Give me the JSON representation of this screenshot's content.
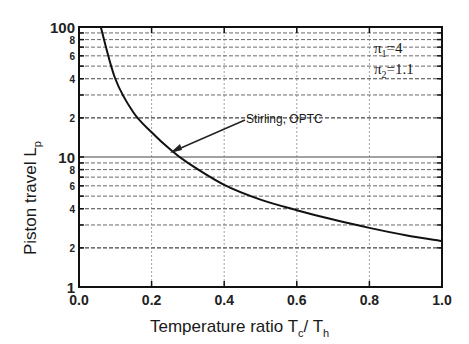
{
  "chart_data": {
    "type": "line",
    "title": "",
    "xlabel": "Temperature ratio Tc/Th",
    "ylabel": "Piston travel Lp",
    "xlim": [
      0.0,
      1.0
    ],
    "ylim": [
      1,
      100
    ],
    "yscale": "log",
    "grid": true,
    "x_ticks": [
      "0.0",
      "0.2",
      "0.4",
      "0.6",
      "0.8",
      "1.0"
    ],
    "y_tick_labels": [
      {
        "value": 1,
        "label": "1"
      },
      {
        "value": 2,
        "label": "2"
      },
      {
        "value": 4,
        "label": "4"
      },
      {
        "value": 6,
        "label": "6"
      },
      {
        "value": 8,
        "label": "8"
      },
      {
        "value": 10,
        "label": "10"
      },
      {
        "value": 20,
        "label": "2"
      },
      {
        "value": 40,
        "label": "4"
      },
      {
        "value": 60,
        "label": "6"
      },
      {
        "value": 80,
        "label": "8"
      },
      {
        "value": 100,
        "label": "100"
      }
    ],
    "series": [
      {
        "name": "Stirling, OPTC",
        "x": [
          0.06,
          0.1,
          0.15,
          0.2,
          0.25,
          0.3,
          0.4,
          0.5,
          0.6,
          0.7,
          0.8,
          0.9,
          1.0
        ],
        "y": [
          100,
          40,
          22,
          15.5,
          11.5,
          9.0,
          6.1,
          4.7,
          3.9,
          3.3,
          2.85,
          2.5,
          2.26
        ]
      }
    ],
    "annotations": [
      {
        "text": "Stirling, OPTC",
        "arrow_to": [
          0.25,
          10.5
        ]
      },
      {
        "text": "π1=4"
      },
      {
        "text": "π2=1.1"
      }
    ]
  },
  "labels": {
    "xlabel_main": "Temperature ratio T",
    "xlabel_sub1": "c",
    "xlabel_slash": "/ T",
    "xlabel_sub2": "h",
    "ylabel_main": "Piston travel L",
    "ylabel_sub": "p",
    "curve_label": "Stirling, OPTC",
    "param1_pi": "π",
    "param1_sub": "1",
    "param1_val": "=4",
    "param2_pi": "π",
    "param2_sub": "2",
    "param2_val": "=1.1"
  }
}
